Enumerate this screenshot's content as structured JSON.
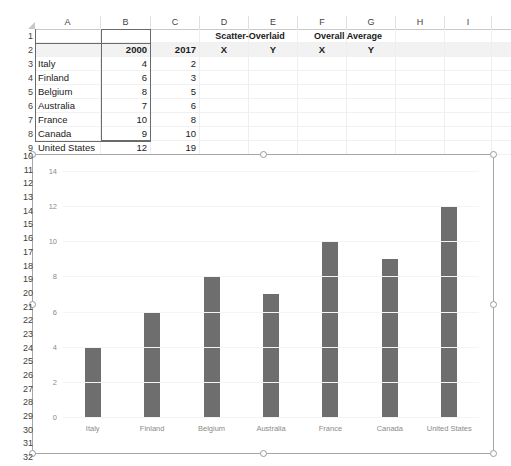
{
  "spreadsheet": {
    "column_headers": [
      "A",
      "B",
      "C",
      "D",
      "E",
      "F",
      "G",
      "H",
      "I",
      "J"
    ],
    "row_headers_top": [
      "1",
      "2",
      "3",
      "4",
      "5",
      "6",
      "7",
      "8",
      "9"
    ],
    "row_headers_chart": [
      "10",
      "11",
      "12",
      "13",
      "14",
      "15",
      "16",
      "17",
      "18",
      "19",
      "20",
      "21",
      "22",
      "23",
      "24",
      "25",
      "26",
      "27",
      "28",
      "29",
      "30",
      "31",
      "32"
    ],
    "rows": [
      {
        "r": "1",
        "A": "",
        "B": "",
        "C": "",
        "D": "",
        "E": "",
        "F": "",
        "G": ""
      },
      {
        "r": "2",
        "A": "",
        "B": "2000",
        "C": "2017",
        "D": "X",
        "E": "Y",
        "F": "X",
        "G": "Y"
      },
      {
        "r": "3",
        "A": "Italy",
        "B": "4",
        "C": "2",
        "D": "",
        "E": "",
        "F": "",
        "G": ""
      },
      {
        "r": "4",
        "A": "Finland",
        "B": "6",
        "C": "3",
        "D": "",
        "E": "",
        "F": "",
        "G": ""
      },
      {
        "r": "5",
        "A": "Belgium",
        "B": "8",
        "C": "5",
        "D": "",
        "E": "",
        "F": "",
        "G": ""
      },
      {
        "r": "6",
        "A": "Australia",
        "B": "7",
        "C": "6",
        "D": "",
        "E": "",
        "F": "",
        "G": ""
      },
      {
        "r": "7",
        "A": "France",
        "B": "10",
        "C": "8",
        "D": "",
        "E": "",
        "F": "",
        "G": ""
      },
      {
        "r": "8",
        "A": "Canada",
        "B": "9",
        "C": "10",
        "D": "",
        "E": "",
        "F": "",
        "G": ""
      },
      {
        "r": "9",
        "A": "United States",
        "B": "12",
        "C": "19",
        "D": "",
        "E": "",
        "F": "",
        "G": ""
      }
    ],
    "group_headers": [
      {
        "label": "Scatter-Overlaid",
        "spans": "D1:E1"
      },
      {
        "label": "Overall Average",
        "spans": "F1:G1"
      }
    ],
    "selected_range": "B1:B9"
  },
  "chart_data": {
    "type": "bar",
    "title": "",
    "xlabel": "",
    "ylabel": "",
    "categories": [
      "Italy",
      "Finland",
      "Belgium",
      "Australia",
      "France",
      "Canada",
      "United States"
    ],
    "values": [
      4,
      6,
      8,
      7,
      10,
      9,
      12
    ],
    "series": [
      {
        "name": "2000",
        "values": [
          4,
          6,
          8,
          7,
          10,
          9,
          12
        ]
      }
    ],
    "ylim": [
      0,
      14
    ],
    "yticks": [
      0,
      2,
      4,
      6,
      8,
      10,
      12,
      14
    ],
    "grid": true,
    "legend": "none",
    "bar_color": "#6e6e6e",
    "selected": true
  }
}
